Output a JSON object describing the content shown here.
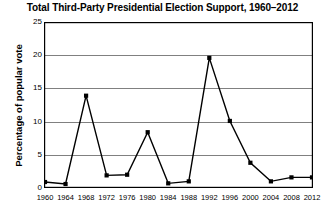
{
  "chart_data": {
    "type": "line",
    "title": "Total Third-Party Presidential Election Support, 1960–2012",
    "xlabel": "",
    "ylabel": "Percentage of popular vote",
    "categories": [
      "1960",
      "1964",
      "1968",
      "1972",
      "1976",
      "1980",
      "1984",
      "1988",
      "1992",
      "1996",
      "2000",
      "2004",
      "2008",
      "2012"
    ],
    "x": [
      1960,
      1964,
      1968,
      1972,
      1976,
      1980,
      1984,
      1988,
      1992,
      1996,
      2000,
      2004,
      2008,
      2012
    ],
    "values": [
      0.9,
      0.6,
      13.9,
      1.9,
      2.0,
      8.4,
      0.7,
      1.0,
      19.6,
      10.1,
      3.8,
      1.0,
      1.6,
      1.6
    ],
    "series": [
      {
        "name": "Total third-party support",
        "values": [
          0.9,
          0.6,
          13.9,
          1.9,
          2.0,
          8.4,
          0.7,
          1.0,
          19.6,
          10.1,
          3.8,
          1.0,
          1.6,
          1.6
        ]
      }
    ],
    "ylim": [
      0,
      25
    ],
    "xlim": [
      1960,
      2012
    ],
    "yticks": [
      0,
      5,
      10,
      15,
      20,
      25
    ],
    "ytick_labels": [
      "0",
      "5",
      "10",
      "15",
      "20",
      "25"
    ],
    "xticks": [
      1960,
      1964,
      1968,
      1972,
      1976,
      1980,
      1984,
      1988,
      1992,
      1996,
      2000,
      2004,
      2008,
      2012
    ],
    "grid": "horizontal",
    "legend": "none",
    "marker": "square",
    "colors": {
      "line": "#000000",
      "marker": "#000000",
      "grid": "#808080",
      "axis": "#000000",
      "background": "#ffffff"
    }
  }
}
